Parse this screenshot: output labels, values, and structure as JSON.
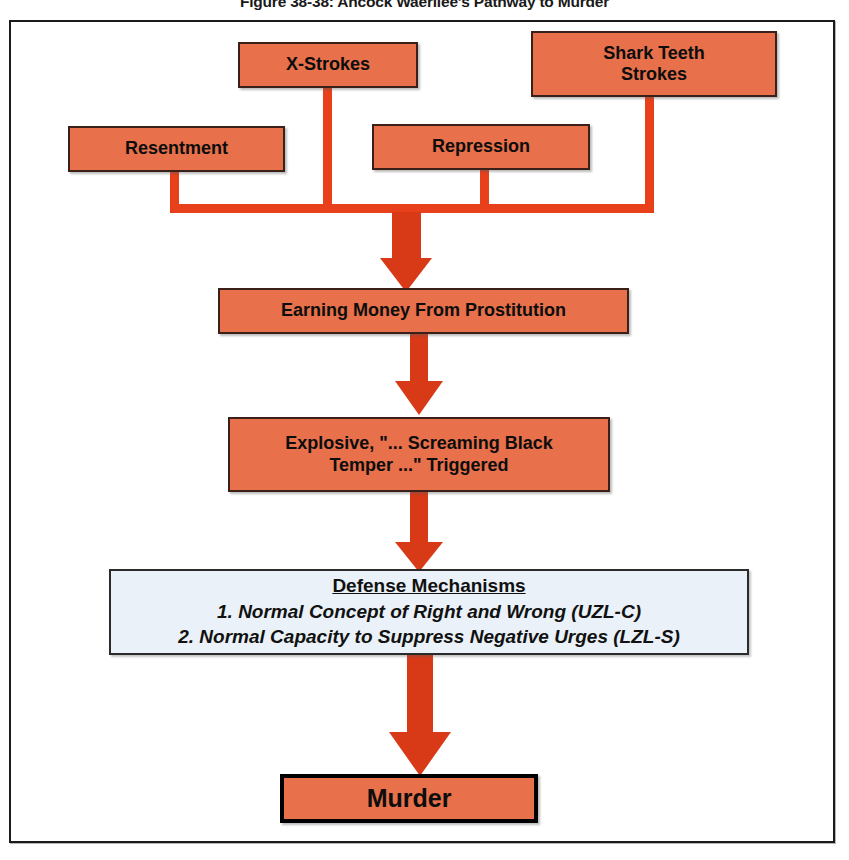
{
  "figure": {
    "title": "Figure 38-38: Ahcock Waerilee's Pathway to Murder",
    "frame_border_color": "#1b1b1b",
    "background": "#ffffff"
  },
  "palette": {
    "node_fill": "#e8704a",
    "node_border": "#3a2018",
    "connector": "#e8401b",
    "arrow": "#d83a18",
    "defense_fill": "#eaf1f8",
    "terminal_border": "#000000",
    "text": "#0d0d0d"
  },
  "nodes": {
    "x_strokes": {
      "label": "X-Strokes",
      "fill": "#e8704a"
    },
    "shark_teeth": {
      "label": "Shark Teeth\nStrokes",
      "line1": "Shark Teeth",
      "line2": "Strokes",
      "fill": "#e8704a"
    },
    "resentment": {
      "label": "Resentment",
      "fill": "#e8704a"
    },
    "repression": {
      "label": "Repression",
      "fill": "#e8704a"
    },
    "earning_money": {
      "label": "Earning Money From Prostitution",
      "fill": "#e8704a"
    },
    "explosive": {
      "line1": "Explosive, \"... Screaming Black",
      "line2": "Temper ...\" Triggered",
      "fill": "#e8704a"
    },
    "defense": {
      "heading": "Defense Mechanisms",
      "item1": "1. Normal Concept of Right and Wrong (UZL-C)",
      "item2": "2. Normal Capacity to Suppress Negative Urges (LZL-S)",
      "fill": "#eaf1f8"
    },
    "murder": {
      "label": "Murder",
      "fill": "#e8704a"
    }
  },
  "flow": {
    "description": "Four antecedent factors converge on a horizontal bus, which flows down through Earning Money From Prostitution, Explosive Temper Triggered, Defense Mechanisms, to Murder.",
    "sources": [
      "X-Strokes",
      "Shark Teeth Strokes",
      "Resentment",
      "Repression"
    ],
    "chain": [
      "Earning Money From Prostitution",
      "Explosive, \"... Screaming Black Temper ...\" Triggered",
      "Defense Mechanisms",
      "Murder"
    ]
  }
}
